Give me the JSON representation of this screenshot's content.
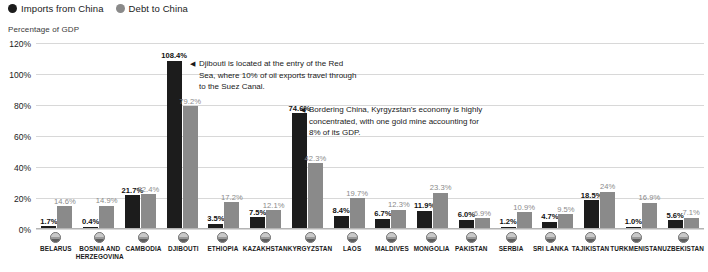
{
  "legend": {
    "items": [
      {
        "label": "Imports from China",
        "color": "#1c1c1c",
        "icon": "filled-circle-icon"
      },
      {
        "label": "Debt to China",
        "color": "#8a8a8a",
        "icon": "filled-circle-icon"
      }
    ]
  },
  "axis_caption": "Percentage of GDP",
  "annotations": [
    {
      "id": "djibouti",
      "marker": "◀",
      "text": "Djibouti is located at the entry of the Red Sea, where 10% of oil exports travel through to the Suez Canal."
    },
    {
      "id": "kyrgyzstan",
      "marker": "◀",
      "text": "Bordering China, Kyrgyzstan's economy is highly concentrated, with one gold mine accounting for 8% of its GDP."
    }
  ],
  "chart_data": {
    "type": "bar",
    "title": "",
    "subtitle": "",
    "xlabel": "",
    "ylabel": "Percentage of GDP",
    "ylim": [
      0,
      120
    ],
    "ytick_labels": [
      "0%",
      "20%",
      "40%",
      "60%",
      "80%",
      "100%",
      "120%"
    ],
    "ytick_values": [
      0,
      20,
      40,
      60,
      80,
      100,
      120
    ],
    "grid": true,
    "legend_position": "top-left",
    "categories": [
      "BELARUS",
      "BOSNIA AND HERZEGOVINA",
      "CAMBODIA",
      "DJIBOUTI",
      "ETHIOPIA",
      "KAZAKHSTAN",
      "KYRGYZSTAN",
      "LAOS",
      "MALDIVES",
      "MONGOLIA",
      "PAKISTAN",
      "SERBIA",
      "SRI LANKA",
      "TAJIKISTAN",
      "TURKMENISTAN",
      "UZBEKISTAN"
    ],
    "series": [
      {
        "name": "Imports from China",
        "color": "#1c1c1c",
        "values": [
          1.7,
          0.4,
          21.7,
          108.4,
          3.5,
          7.5,
          74.6,
          8.4,
          6.7,
          11.9,
          6.0,
          1.2,
          4.7,
          18.5,
          1.0,
          5.6
        ],
        "labels": [
          "1.7%",
          "0.4%",
          "21.7%",
          "108.4%",
          "3.5%",
          "7.5%",
          "74.6%",
          "8.4%",
          "6.7%",
          "11.9%",
          "6.0%",
          "1.2%",
          "4.7%",
          "18.5%",
          "1.0%",
          "5.6%"
        ]
      },
      {
        "name": "Debt to China",
        "color": "#8a8a8a",
        "values": [
          14.6,
          14.9,
          22.4,
          79.2,
          17.2,
          12.1,
          42.3,
          19.7,
          12.3,
          23.3,
          6.9,
          10.9,
          9.5,
          24.0,
          16.9,
          7.1
        ],
        "labels": [
          "14.6%",
          "14.9%",
          "22.4%",
          "79.2%",
          "17.2%",
          "12.1%",
          "42.3%",
          "19.7%",
          "12.3%",
          "23.3%",
          "6.9%",
          "10.9%",
          "9.5%",
          "24%",
          "16.9%",
          "7.1%"
        ]
      }
    ]
  }
}
